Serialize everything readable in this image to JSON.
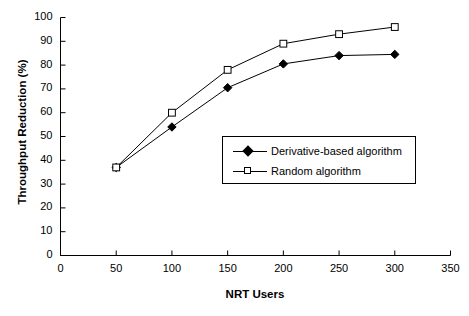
{
  "chart_data": {
    "type": "line",
    "title": "",
    "xlabel": "NRT Users",
    "ylabel": "Throughput Reduction (%)",
    "x": [
      50,
      100,
      150,
      200,
      250,
      300
    ],
    "xlim": [
      0,
      350
    ],
    "ylim": [
      0,
      100
    ],
    "xticks": [
      0,
      50,
      100,
      150,
      200,
      250,
      300,
      350
    ],
    "yticks": [
      0,
      10,
      20,
      30,
      40,
      50,
      60,
      70,
      80,
      90,
      100
    ],
    "xtick_labels": [
      "0",
      "50",
      "100",
      "150",
      "200",
      "250",
      "300",
      "350"
    ],
    "ytick_labels": [
      "0",
      "10",
      "20",
      "30",
      "40",
      "50",
      "60",
      "70",
      "80",
      "90",
      "100"
    ],
    "grid": false,
    "legend_position": "center-right-inside",
    "series": [
      {
        "name": "Derivative-based algorithm",
        "marker": "filled-diamond",
        "color": "#000000",
        "values": [
          37,
          54,
          70.5,
          80.5,
          84,
          84.5
        ]
      },
      {
        "name": "Random algorithm",
        "marker": "open-square",
        "color": "#000000",
        "values": [
          37,
          60,
          78,
          89,
          93,
          96
        ]
      }
    ]
  },
  "legend": {
    "items": [
      {
        "label": "Derivative-based algorithm",
        "marker": "filled-diamond"
      },
      {
        "label": "Random algorithm",
        "marker": "open-square"
      }
    ]
  },
  "axes": {
    "x_label": "NRT Users",
    "y_label": "Throughput Reduction (%)"
  },
  "colors": {
    "axis": "#000000",
    "line": "#000000",
    "background": "#ffffff"
  }
}
